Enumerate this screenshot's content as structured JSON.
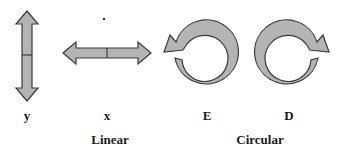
{
  "diagram": {
    "colors": {
      "fill": "#b4b4b4",
      "stroke": "#3a3a3a"
    },
    "arrows": [
      {
        "id": "y",
        "label": "y",
        "kind": "double-vertical-arrow"
      },
      {
        "id": "x",
        "label": "x",
        "kind": "double-horizontal-arrow"
      },
      {
        "id": "E",
        "label": "E",
        "kind": "counterclockwise-circular-arrow"
      },
      {
        "id": "D",
        "label": "D",
        "kind": "clockwise-circular-arrow"
      }
    ],
    "groups": [
      {
        "label": "Linear"
      },
      {
        "label": "Circular"
      }
    ]
  }
}
